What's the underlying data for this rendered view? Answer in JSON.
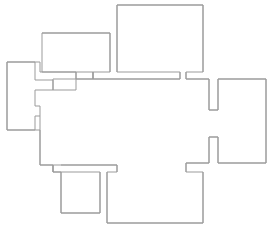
{
  "diagram": {
    "type": "line-drawing",
    "background_color": "#ffffff",
    "stroke_color": "#9b9b9b",
    "stroke_width": 1,
    "canvas": {
      "width": 274,
      "height": 231
    },
    "shapes": [
      {
        "name": "main-outline",
        "label": "Main floor plan outline",
        "closed": true,
        "points": "117,5 203,5 203,72 186,72 186,79 209,79 209,110 218,110 218,79 266,79 266,163 218,163 218,137 209,137 209,163 186,163 186,172 203,172 203,223 107,223 107,172 117,172 117,165 61,165 61,172 100,172 100,213 61,213 61,172 53,172 53,165 40,165 40,116 35,116 35,106 40,106 40,72 53,72 53,79 76,79 76,72 42,72 42,33 110,33 110,72 93,72 93,79 180,79 180,72 117,72"
      },
      {
        "name": "left-wing-outline",
        "label": "Left wing rectangle with connector notches",
        "closed": true,
        "points": "7,62 35,62 35,80 53,80 53,90 35,90 35,116 40,116 40,106 35,106 35,130 7,130"
      }
    ]
  }
}
